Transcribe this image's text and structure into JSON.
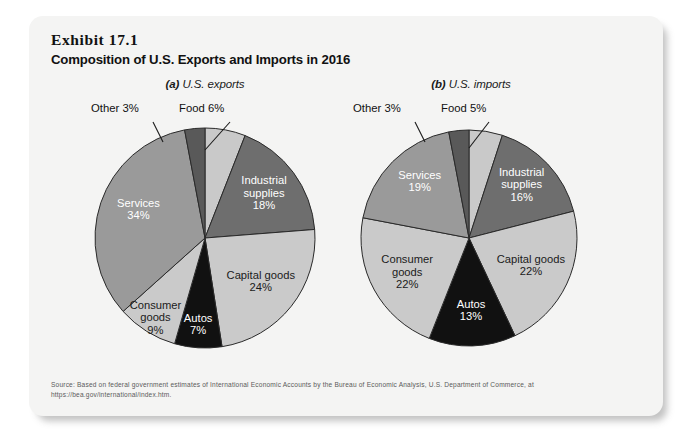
{
  "exhibit": {
    "number": "Exhibit 17.1",
    "title": "Composition of U.S. Exports and Imports in 2016"
  },
  "source": {
    "line1": "Source: Based on federal government estimates of International Economic Accounts by the Bureau of Economic Analysis, U.S. Department of Commerce, at",
    "line2": "https://bea.gov/international/index.htm."
  },
  "panels": {
    "exports": {
      "caption_prefix": "(a)",
      "caption_text": " U.S. exports",
      "callout_other": "Other 3%",
      "callout_food": "Food 6%"
    },
    "imports": {
      "caption_prefix": "(b)",
      "caption_text": " U.S. imports",
      "callout_other": "Other 3%",
      "callout_food": "Food 5%"
    }
  },
  "colors": {
    "card_background": "#f4f4f3",
    "page_background": "#ffffff",
    "food": "#c9c9c9",
    "industrial_supplies": "#6e6e6e",
    "capital_goods": "#cacaca",
    "autos": "#111111",
    "consumer_goods": "#cacaca",
    "services": "#9a9a9a",
    "other": "#595959",
    "slice_outline": "#2a2a2a",
    "text_dark": "#111111",
    "text_light": "#ffffff",
    "source_text": "#5b5b5b"
  },
  "chart_data": [
    {
      "type": "pie",
      "title": "(a) U.S. exports",
      "id": "us-exports",
      "unit": "percent",
      "total": 101,
      "legend": "none",
      "start_angle_deg": 0,
      "direction": "clockwise",
      "categories": [
        "Food",
        "Industrial supplies",
        "Capital goods",
        "Autos",
        "Consumer goods",
        "Services",
        "Other"
      ],
      "values": [
        6,
        18,
        24,
        7,
        9,
        34,
        3
      ],
      "slices": [
        {
          "name": "Food",
          "value": 6,
          "label": "Food 6%",
          "label_placement": "callout",
          "color": "#c9c9c9",
          "text_color": "#111111"
        },
        {
          "name": "Industrial supplies",
          "value": 18,
          "label_line1": "Industrial",
          "label_line2": "supplies",
          "label_line3": "18%",
          "label_placement": "inside",
          "color": "#6e6e6e",
          "text_color": "#ffffff"
        },
        {
          "name": "Capital goods",
          "value": 24,
          "label_line1": "Capital goods",
          "label_line2": "24%",
          "label_placement": "inside",
          "color": "#cacaca",
          "text_color": "#1b1b1b"
        },
        {
          "name": "Autos",
          "value": 7,
          "label_line1": "Autos",
          "label_line2": "7%",
          "label_placement": "inside",
          "color": "#111111",
          "text_color": "#ffffff"
        },
        {
          "name": "Consumer goods",
          "value": 9,
          "label_line1": "Consumer",
          "label_line2": "goods",
          "label_line3": "9%",
          "label_placement": "inside",
          "color": "#cacaca",
          "text_color": "#1b1b1b"
        },
        {
          "name": "Services",
          "value": 34,
          "label_line1": "Services",
          "label_line2": "34%",
          "label_placement": "inside",
          "color": "#9a9a9a",
          "text_color": "#ffffff"
        },
        {
          "name": "Other",
          "value": 3,
          "label": "Other 3%",
          "label_placement": "callout",
          "color": "#595959",
          "text_color": "#111111"
        }
      ]
    },
    {
      "type": "pie",
      "title": "(b) U.S. imports",
      "id": "us-imports",
      "unit": "percent",
      "total": 100,
      "legend": "none",
      "start_angle_deg": 0,
      "direction": "clockwise",
      "categories": [
        "Food",
        "Industrial supplies",
        "Capital goods",
        "Autos",
        "Consumer goods",
        "Services",
        "Other"
      ],
      "values": [
        5,
        16,
        22,
        13,
        22,
        19,
        3
      ],
      "slices": [
        {
          "name": "Food",
          "value": 5,
          "label": "Food 5%",
          "label_placement": "callout",
          "color": "#c9c9c9",
          "text_color": "#111111"
        },
        {
          "name": "Industrial supplies",
          "value": 16,
          "label_line1": "Industrial",
          "label_line2": "supplies",
          "label_line3": "16%",
          "label_placement": "inside",
          "color": "#6e6e6e",
          "text_color": "#ffffff"
        },
        {
          "name": "Capital goods",
          "value": 22,
          "label_line1": "Capital goods",
          "label_line2": "22%",
          "label_placement": "inside",
          "color": "#cacaca",
          "text_color": "#1b1b1b"
        },
        {
          "name": "Autos",
          "value": 13,
          "label_line1": "Autos",
          "label_line2": "13%",
          "label_placement": "inside",
          "color": "#111111",
          "text_color": "#ffffff"
        },
        {
          "name": "Consumer goods",
          "value": 22,
          "label_line1": "Consumer",
          "label_line2": "goods",
          "label_line3": "22%",
          "label_placement": "inside",
          "color": "#cacaca",
          "text_color": "#1b1b1b"
        },
        {
          "name": "Services",
          "value": 19,
          "label_line1": "Services",
          "label_line2": "19%",
          "label_placement": "inside",
          "color": "#9a9a9a",
          "text_color": "#ffffff"
        },
        {
          "name": "Other",
          "value": 3,
          "label": "Other 3%",
          "label_placement": "callout",
          "color": "#595959",
          "text_color": "#111111"
        }
      ]
    }
  ]
}
